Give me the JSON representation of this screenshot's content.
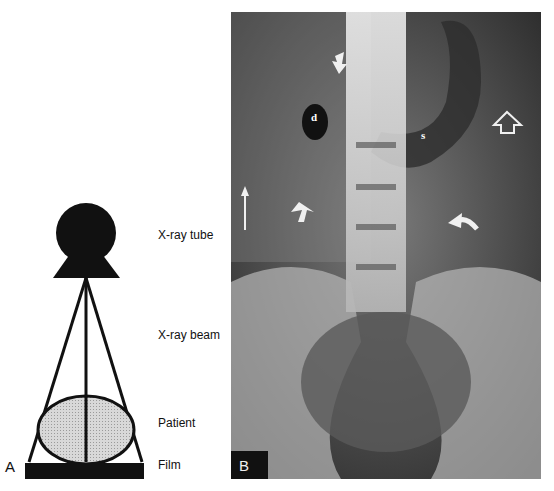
{
  "panel_a": {
    "letter": "A",
    "labels": {
      "tube": "X-ray tube",
      "beam": "X-ray beam",
      "patient": "Patient",
      "film": "Film"
    }
  },
  "panel_b": {
    "letter": "B",
    "annotations": {
      "duodenum": "d",
      "stomach": "s"
    },
    "arrow_icons": [
      "short-arrow-down",
      "thin-arrow-up",
      "short-arrow-up",
      "curved-arrow",
      "hollow-arrow-up"
    ]
  },
  "colors": {
    "diagram_fill": "#111111",
    "patient_fill": "#cfcfcf",
    "xray_bg": "#2a2a2a"
  }
}
